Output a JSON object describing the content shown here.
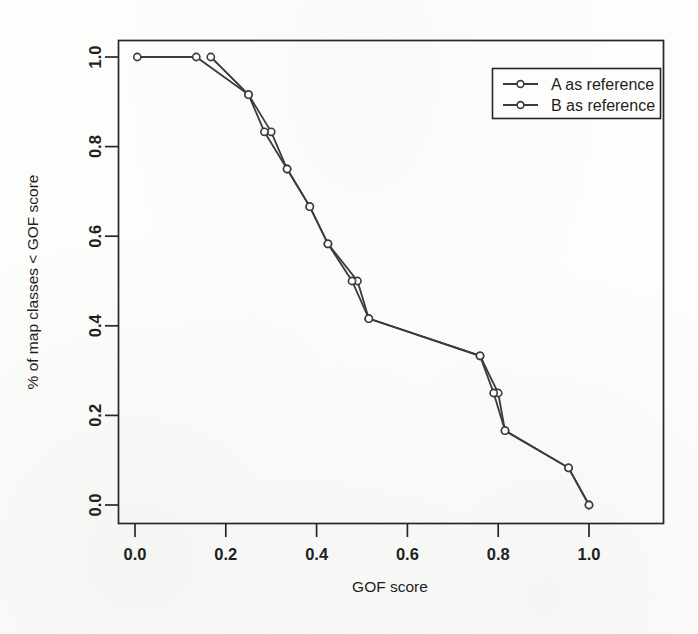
{
  "chart_data": {
    "type": "line",
    "title": "",
    "subtitle": "",
    "xlabel": "GOF score",
    "ylabel": "% of map classes < GOF score",
    "xlim": [
      -0.04,
      1.12
    ],
    "ylim": [
      -0.04,
      1.04
    ],
    "xticks": [
      0.0,
      0.2,
      0.4,
      0.6,
      0.8,
      1.0
    ],
    "xticklabels": [
      "0.0",
      "0.2",
      "0.4",
      "0.6",
      "0.8",
      "1.0"
    ],
    "yticks": [
      0.0,
      0.2,
      0.4,
      0.6,
      0.8,
      1.0
    ],
    "yticklabels": [
      "0.0",
      "0.2",
      "0.4",
      "0.6",
      "0.8",
      "1.0"
    ],
    "grid": false,
    "marker": "open-circle",
    "legend": {
      "position": "upper-right",
      "boxed": true,
      "entries": [
        {
          "label": "A as reference",
          "color": "#3a3a3f",
          "marker": "open-circle"
        },
        {
          "label": "B as reference",
          "color": "#3a3a3f",
          "marker": "open-circle"
        }
      ]
    },
    "series": [
      {
        "name": "A as reference",
        "color": "#3a3a3f",
        "points": [
          [
            0.005,
            1.0
          ],
          [
            0.135,
            1.0
          ],
          [
            0.25,
            0.916
          ],
          [
            0.3,
            0.833
          ],
          [
            0.335,
            0.75
          ],
          [
            0.385,
            0.666
          ],
          [
            0.425,
            0.583
          ],
          [
            0.49,
            0.5
          ],
          [
            0.515,
            0.416
          ],
          [
            0.76,
            0.333
          ],
          [
            0.8,
            0.25
          ],
          [
            0.815,
            0.166
          ],
          [
            0.955,
            0.083
          ],
          [
            1.0,
            0.0
          ]
        ]
      },
      {
        "name": "B as reference",
        "color": "#3a3a3f",
        "points": [
          [
            0.167,
            1.0
          ],
          [
            0.25,
            0.916
          ],
          [
            0.285,
            0.833
          ],
          [
            0.335,
            0.75
          ],
          [
            0.385,
            0.666
          ],
          [
            0.425,
            0.583
          ],
          [
            0.478,
            0.5
          ],
          [
            0.515,
            0.416
          ],
          [
            0.76,
            0.333
          ],
          [
            0.79,
            0.25
          ],
          [
            0.815,
            0.166
          ],
          [
            0.955,
            0.083
          ],
          [
            1.0,
            0.0
          ]
        ]
      }
    ]
  }
}
